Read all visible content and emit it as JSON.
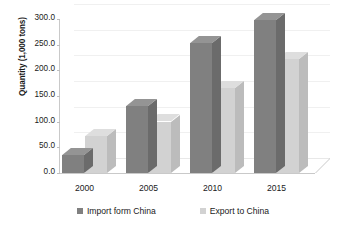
{
  "chart_data": {
    "type": "bar",
    "title": "",
    "subtitle": "",
    "xlabel": "",
    "ylabel": "Quantity (1,000 tons)",
    "categories": [
      "2000",
      "2005",
      "2010",
      "2015"
    ],
    "series": [
      {
        "name": "Import form China",
        "color": "#808080",
        "values": [
          35,
          130,
          253,
          298
        ]
      },
      {
        "name": "Export to China",
        "color": "#d2d2d2",
        "values": [
          72,
          100,
          165,
          222
        ]
      }
    ],
    "ylim": [
      0,
      300
    ],
    "ytick_step": 50,
    "ytick_labels": [
      "0.0",
      "50.0",
      "100.0",
      "150.0",
      "200.0",
      "250.0",
      "300.0"
    ],
    "ytick_values": [
      0,
      50,
      100,
      150,
      200,
      250,
      300
    ],
    "grid": true,
    "grid_axis": "y",
    "legend_position": "bottom",
    "style": "3d-clustered-column",
    "background_color": "#ffffff",
    "axis_color": "#c9c9c9",
    "text_color": "#1a1a1a"
  }
}
